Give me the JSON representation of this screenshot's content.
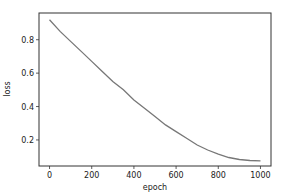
{
  "chart_data": {
    "type": "line",
    "title": "",
    "xlabel": "epoch",
    "ylabel": "loss",
    "xlim": [
      -50,
      1050
    ],
    "ylim": [
      0.044,
      0.96
    ],
    "xticks": [
      0,
      200,
      400,
      600,
      800,
      1000
    ],
    "xtick_labels": [
      "0",
      "200",
      "400",
      "600",
      "800",
      "1000"
    ],
    "yticks": [
      0.2,
      0.4,
      0.6,
      0.8
    ],
    "ytick_labels": [
      "0.2",
      "0.4",
      "0.6",
      "0.8"
    ],
    "grid": false,
    "legend": null,
    "series": [
      {
        "name": "loss",
        "color": "#777777",
        "x": [
          0,
          50,
          100,
          150,
          200,
          250,
          300,
          350,
          400,
          450,
          500,
          550,
          600,
          650,
          700,
          750,
          800,
          850,
          900,
          950,
          1000
        ],
        "values": [
          0.92,
          0.85,
          0.79,
          0.73,
          0.67,
          0.61,
          0.55,
          0.5,
          0.44,
          0.39,
          0.34,
          0.29,
          0.25,
          0.21,
          0.17,
          0.14,
          0.115,
          0.095,
          0.083,
          0.077,
          0.075
        ]
      }
    ]
  }
}
